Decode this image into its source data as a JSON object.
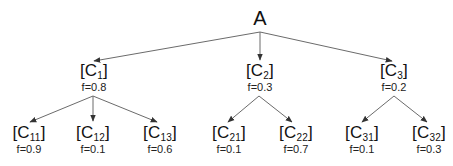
{
  "diagram": {
    "type": "tree",
    "root": {
      "id": "A",
      "label": "A"
    },
    "level1": [
      {
        "id": "C1",
        "bracket_open": "[C",
        "sub": "1",
        "bracket_close": "]",
        "f": "f=0.8"
      },
      {
        "id": "C2",
        "bracket_open": "[C",
        "sub": "2",
        "bracket_close": "]",
        "f": "f=0.3"
      },
      {
        "id": "C3",
        "bracket_open": "[C",
        "sub": "3",
        "bracket_close": "]",
        "f": "f=0.2"
      }
    ],
    "level2": [
      {
        "id": "C11",
        "parent": "C1",
        "bracket_open": "[C",
        "sub": "11",
        "bracket_close": "]",
        "f": "f=0.9"
      },
      {
        "id": "C12",
        "parent": "C1",
        "bracket_open": "[C",
        "sub": "12",
        "bracket_close": "]",
        "f": "f=0.1"
      },
      {
        "id": "C13",
        "parent": "C1",
        "bracket_open": "[C",
        "sub": "13",
        "bracket_close": "]",
        "f": "f=0.6"
      },
      {
        "id": "C21",
        "parent": "C2",
        "bracket_open": "[C",
        "sub": "21",
        "bracket_close": "]",
        "f": "f=0.1"
      },
      {
        "id": "C22",
        "parent": "C2",
        "bracket_open": "[C",
        "sub": "22",
        "bracket_close": "]",
        "f": "f=0.7"
      },
      {
        "id": "C31",
        "parent": "C3",
        "bracket_open": "[C",
        "sub": "31",
        "bracket_close": "]",
        "f": "f=0.1"
      },
      {
        "id": "C32",
        "parent": "C3",
        "bracket_open": "[C",
        "sub": "32",
        "bracket_close": "]",
        "f": "f=0.3"
      }
    ],
    "colors": {
      "edge": "#6b6b6b",
      "text": "#111111",
      "background": "#ffffff"
    }
  }
}
